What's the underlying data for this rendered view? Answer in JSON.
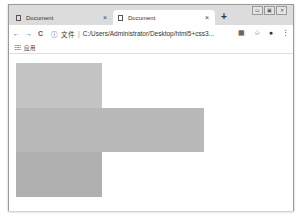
{
  "window": {
    "controls": {
      "minimize": "▭",
      "maximize": "▣",
      "close": "✕"
    }
  },
  "tabs": [
    {
      "title": "Document",
      "active": false,
      "close": "×"
    },
    {
      "title": "Document",
      "active": true,
      "close": "×"
    }
  ],
  "new_tab": "+",
  "toolbar": {
    "back": "←",
    "forward": "→",
    "reload": "C",
    "info_icon": "ⓘ",
    "scheme_label": "文件",
    "separator": "|",
    "url": "C:/Users/Administrator/Desktop/html5+css3...",
    "translate_icon": "▦",
    "star_icon": "☆",
    "account_icon": "●",
    "menu_icon": "⋮"
  },
  "bookmarks": {
    "apps_icon": "⠿⠿",
    "apps_label": "应用"
  },
  "boxes": [
    {
      "name": "box-1",
      "left": 7,
      "top": 9,
      "width": 86,
      "height": 45,
      "color": "#c4c4c4"
    },
    {
      "name": "box-2",
      "left": 7,
      "top": 54,
      "width": 188,
      "height": 44,
      "color": "#b9b9b9"
    },
    {
      "name": "box-3",
      "left": 7,
      "top": 98,
      "width": 86,
      "height": 45,
      "color": "#b0b0b0"
    }
  ]
}
